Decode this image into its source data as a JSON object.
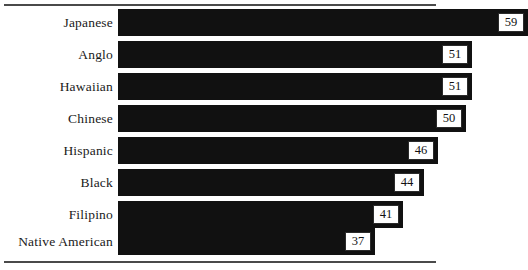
{
  "chart_data": {
    "type": "bar",
    "orientation": "horizontal",
    "title": "",
    "subtitle": "",
    "xlabel": "",
    "ylabel": "",
    "grid": false,
    "legend": false,
    "xlim": [
      0,
      62
    ],
    "categories": [
      "Japanese",
      "Anglo",
      "Hawaiian",
      "Chinese",
      "Hispanic",
      "Black",
      "Filipino",
      "Native American"
    ],
    "values": [
      59,
      51,
      51,
      50,
      46,
      44,
      41,
      37
    ],
    "data_labels": [
      "59",
      "51",
      "51",
      "50",
      "46",
      "44",
      "41",
      "37"
    ],
    "bar_color": "#111111",
    "label_box_color": "#ffffff",
    "label_box_border_color": "#2b2b2b",
    "background_color": "#ffffff",
    "rule_color": "#4a4a4a",
    "bars": [
      {
        "category": "Japanese",
        "value": 59,
        "label": "59"
      },
      {
        "category": "Anglo",
        "value": 51,
        "label": "51"
      },
      {
        "category": "Hawaiian",
        "value": 51,
        "label": "51"
      },
      {
        "category": "Chinese",
        "value": 50,
        "label": "50"
      },
      {
        "category": "Hispanic",
        "value": 46,
        "label": "46"
      },
      {
        "category": "Black",
        "value": 44,
        "label": "44"
      },
      {
        "category": "Filipino",
        "value": 41,
        "label": "41"
      },
      {
        "category": "Native American",
        "value": 37,
        "label": "37"
      }
    ]
  }
}
